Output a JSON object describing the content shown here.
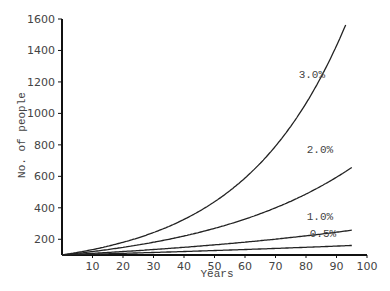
{
  "chart_data": {
    "type": "line",
    "title": "",
    "xlabel": "Years",
    "ylabel": "No. of people",
    "xlim": [
      0,
      100
    ],
    "ylim": [
      100,
      1600
    ],
    "xticks": [
      10,
      20,
      30,
      40,
      50,
      60,
      70,
      80,
      90,
      100
    ],
    "yticks": [
      200,
      400,
      600,
      800,
      1000,
      1200,
      1400,
      1600
    ],
    "grid": false,
    "legend": "inline labels at curve ends",
    "series": [
      {
        "name": "3.0%",
        "rate": 0.03,
        "x": [
          0,
          10,
          20,
          30,
          40,
          50,
          60,
          70,
          80,
          90,
          93
        ],
        "values": [
          100,
          134,
          181,
          243,
          326,
          438,
          589,
          792,
          1064,
          1430,
          1563
        ]
      },
      {
        "name": "2.0%",
        "rate": 0.02,
        "x": [
          0,
          10,
          20,
          30,
          40,
          50,
          60,
          70,
          80,
          90,
          95
        ],
        "values": [
          100,
          122,
          149,
          182,
          223,
          272,
          332,
          406,
          495,
          605,
          669
        ]
      },
      {
        "name": "1.0%",
        "rate": 0.01,
        "x": [
          0,
          10,
          20,
          30,
          40,
          50,
          60,
          70,
          80,
          90,
          95
        ],
        "values": [
          100,
          110,
          122,
          135,
          149,
          165,
          182,
          201,
          222,
          246,
          259
        ]
      },
      {
        "name": "0.5%",
        "rate": 0.005,
        "x": [
          0,
          10,
          20,
          30,
          40,
          50,
          60,
          70,
          80,
          90,
          95
        ],
        "values": [
          100,
          105,
          110,
          116,
          122,
          128,
          135,
          142,
          149,
          157,
          161
        ]
      }
    ]
  }
}
